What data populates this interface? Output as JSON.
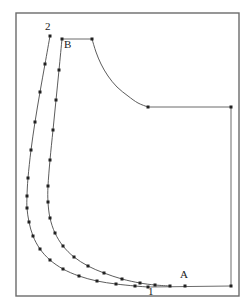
{
  "figure": {
    "background_color": "#ffffff",
    "frame": {
      "name": "outer-frame",
      "x": 16,
      "y": 13,
      "width": 223,
      "height": 283,
      "stroke_color": "#6b6b6b"
    },
    "labels": [
      {
        "id": "label-2",
        "text": "2",
        "x": 45,
        "y": 30
      },
      {
        "id": "label-B",
        "text": "B",
        "x": 64,
        "y": 48
      },
      {
        "id": "label-A",
        "text": "A",
        "x": 180,
        "y": 278
      },
      {
        "id": "label-1",
        "text": "1",
        "x": 148,
        "y": 295
      }
    ],
    "curves": [
      {
        "id": "outer-curve",
        "name": "outer-boundary-curve",
        "stroke_color": "#4a4a4a",
        "points": [
          [
            50,
            36
          ],
          [
            45,
            64
          ],
          [
            40,
            92
          ],
          [
            35,
            122
          ],
          [
            31,
            150
          ],
          [
            28,
            178
          ],
          [
            27,
            196
          ],
          [
            27,
            208
          ],
          [
            29,
            222
          ],
          [
            33,
            236
          ],
          [
            40,
            249
          ],
          [
            50,
            260
          ],
          [
            63,
            269
          ],
          [
            79,
            276
          ],
          [
            97,
            281
          ],
          [
            116,
            284
          ],
          [
            135,
            286
          ],
          [
            148,
            287
          ]
        ],
        "markers": [
          [
            50,
            36
          ],
          [
            45,
            64
          ],
          [
            40,
            92
          ],
          [
            35,
            122
          ],
          [
            31,
            150
          ],
          [
            28,
            178
          ],
          [
            27,
            196
          ],
          [
            27,
            208
          ],
          [
            29,
            222
          ],
          [
            33,
            236
          ],
          [
            40,
            249
          ],
          [
            50,
            260
          ],
          [
            63,
            269
          ],
          [
            79,
            276
          ],
          [
            97,
            281
          ],
          [
            116,
            284
          ],
          [
            135,
            286
          ],
          [
            148,
            287
          ]
        ]
      },
      {
        "id": "inner-curve",
        "name": "inner-boundary-curve",
        "stroke_color": "#4a4a4a",
        "points": [
          [
            62,
            39
          ],
          [
            59,
            70
          ],
          [
            56,
            100
          ],
          [
            53,
            130
          ],
          [
            50,
            160
          ],
          [
            48,
            186
          ],
          [
            48,
            202
          ],
          [
            50,
            218
          ],
          [
            55,
            233
          ],
          [
            63,
            246
          ],
          [
            74,
            257
          ],
          [
            88,
            266
          ],
          [
            104,
            273
          ],
          [
            122,
            279
          ],
          [
            140,
            283
          ],
          [
            155,
            285
          ],
          [
            170,
            286
          ]
        ],
        "markers": [
          [
            62,
            39
          ],
          [
            59,
            70
          ],
          [
            56,
            100
          ],
          [
            53,
            130
          ],
          [
            50,
            160
          ],
          [
            48,
            186
          ],
          [
            48,
            202
          ],
          [
            50,
            218
          ],
          [
            55,
            233
          ],
          [
            63,
            246
          ],
          [
            74,
            257
          ],
          [
            88,
            266
          ],
          [
            104,
            273
          ],
          [
            122,
            279
          ],
          [
            140,
            283
          ],
          [
            155,
            285
          ],
          [
            170,
            286
          ]
        ]
      },
      {
        "id": "top-shoulder-curve",
        "name": "top-shoulder-curve",
        "stroke_color": "#4a4a4a",
        "points": [
          [
            92,
            39
          ],
          [
            96,
            52
          ],
          [
            101,
            64
          ],
          [
            108,
            76
          ],
          [
            117,
            87
          ],
          [
            128,
            96
          ],
          [
            138,
            103
          ],
          [
            148,
            107
          ]
        ],
        "markers": [
          [
            92,
            39
          ],
          [
            148,
            107
          ]
        ]
      }
    ],
    "straight_lines": [
      {
        "id": "segment-B-top",
        "name": "top-horizontal-segment",
        "from": [
          62,
          39
        ],
        "to": [
          92,
          39
        ]
      },
      {
        "id": "segment-upper-right",
        "name": "upper-right-horizontal-segment",
        "from": [
          148,
          107
        ],
        "to": [
          231,
          107
        ]
      },
      {
        "id": "segment-right-vertical",
        "name": "right-vertical-segment",
        "from": [
          231,
          107
        ],
        "to": [
          231,
          286
        ]
      },
      {
        "id": "segment-bottom",
        "name": "bottom-horizontal-segment",
        "from": [
          148,
          287
        ],
        "to": [
          231,
          286
        ]
      }
    ],
    "extra_markers": [
      {
        "id": "marker-A",
        "x": 185,
        "y": 286
      },
      {
        "id": "marker-right-top",
        "x": 231,
        "y": 107
      },
      {
        "id": "marker-right-bottom",
        "x": 231,
        "y": 286
      }
    ]
  }
}
